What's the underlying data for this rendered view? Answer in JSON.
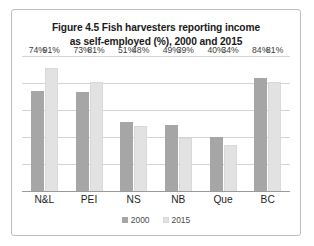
{
  "figure": {
    "title_line_1": "Figure 4.5 Fish harvesters reporting income",
    "title_line_2": "as self-employed (%), 2000 and 2015"
  },
  "legend": {
    "position": "bottom-center",
    "items": [
      {
        "label": "2000",
        "color": "#a6a6a6"
      },
      {
        "label": "2015",
        "color": "#e2e2e2"
      }
    ]
  },
  "chart_data": {
    "type": "bar",
    "title": "Figure 4.5 Fish harvesters reporting income as self-employed (%), 2000 and 2015",
    "xlabel": "",
    "ylabel": "",
    "ylim": [
      0,
      100
    ],
    "grid": true,
    "gridlines": [
      0,
      20,
      40,
      60,
      80,
      100
    ],
    "legend_position": "bottom-center",
    "categories": [
      "N&L",
      "PEI",
      "NS",
      "NB",
      "Que",
      "BC"
    ],
    "series": [
      {
        "name": "2000",
        "color": "#a6a6a6",
        "values": [
          74,
          73,
          51,
          49,
          40,
          84
        ],
        "labels": [
          "74%",
          "73%",
          "51%",
          "49%",
          "40%",
          "84%"
        ]
      },
      {
        "name": "2015",
        "color": "#e2e2e2",
        "values": [
          91,
          81,
          48,
          39,
          34,
          81
        ],
        "labels": [
          "91%",
          "81%",
          "48%",
          "39%",
          "34%",
          "81%"
        ]
      }
    ]
  }
}
